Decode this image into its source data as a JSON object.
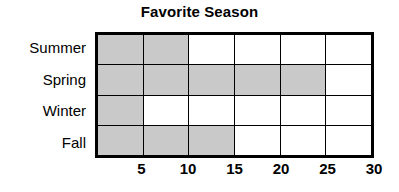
{
  "chart_data": {
    "type": "bar",
    "orientation": "horizontal",
    "title": "Favorite Season",
    "xlabel": "",
    "ylabel": "",
    "categories": [
      "Summer",
      "Spring",
      "Winter",
      "Fall"
    ],
    "values": [
      10,
      25,
      5,
      15
    ],
    "cells_filled": [
      2,
      5,
      1,
      3
    ],
    "cells_total": 6,
    "unit_per_cell": 5,
    "xlim": [
      0,
      30
    ],
    "xticks": [
      "5",
      "10",
      "15",
      "20",
      "25",
      "30"
    ],
    "xtick_values": [
      5,
      10,
      15,
      20,
      25,
      30
    ],
    "grid": true,
    "legend": "none",
    "bar_color": "#c9c9c9",
    "grid_color": "#000000",
    "background_color": "#ffffff"
  }
}
